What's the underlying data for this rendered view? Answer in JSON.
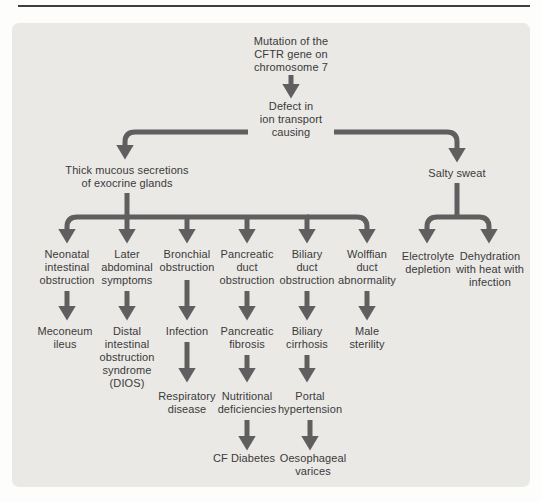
{
  "diagram": {
    "colors": {
      "arrow": "#5f5f5f",
      "text": "#3a3a3a",
      "panel_bg": "#eae9e6",
      "rule": "#3f3f3f"
    },
    "nodes": {
      "mutation": "Mutation of the\nCFTR gene on\nchromosome 7",
      "defect": "Defect in\nion transport\ncausing",
      "thick_mucous": "Thick mucous secretions\nof exocrine glands",
      "salty_sweat": "Salty sweat",
      "neonatal": "Neonatal\nintestinal\nobstruction",
      "later_abdominal": "Later\nabdominal\nsymptoms",
      "bronchial": "Bronchial\nobstruction",
      "pancreatic_duct": "Pancreatic\nduct\nobstruction",
      "biliary_duct": "Biliary\nduct\nobstruction",
      "wolffian": "Wolffian\nduct\nabnormality",
      "electrolyte": "Electrolyte\ndepletion",
      "dehydration": "Dehydration\nwith heat with\ninfection",
      "meconeum": "Meconeum\nileus",
      "dios": "Distal\nintestinal\nobstruction\nsyndrome\n(DIOS)",
      "infection": "Infection",
      "pancreatic_fibrosis": "Pancreatic\nfibrosis",
      "biliary_cirrhosis": "Biliary\ncirrhosis",
      "male_sterility": "Male\nsterility",
      "respiratory": "Respiratory\ndisease",
      "nutritional": "Nutritional\ndeficiencies",
      "portal": "Portal\nhypertension",
      "cf_diabetes": "CF Diabetes",
      "oesophageal": "Oesophageal\nvarices"
    },
    "edges": [
      [
        "mutation",
        "defect"
      ],
      [
        "defect",
        "thick_mucous"
      ],
      [
        "defect",
        "salty_sweat"
      ],
      [
        "thick_mucous",
        "neonatal"
      ],
      [
        "thick_mucous",
        "later_abdominal"
      ],
      [
        "thick_mucous",
        "bronchial"
      ],
      [
        "thick_mucous",
        "pancreatic_duct"
      ],
      [
        "thick_mucous",
        "biliary_duct"
      ],
      [
        "thick_mucous",
        "wolffian"
      ],
      [
        "salty_sweat",
        "electrolyte"
      ],
      [
        "salty_sweat",
        "dehydration"
      ],
      [
        "neonatal",
        "meconeum"
      ],
      [
        "later_abdominal",
        "dios"
      ],
      [
        "bronchial",
        "infection"
      ],
      [
        "pancreatic_duct",
        "pancreatic_fibrosis"
      ],
      [
        "biliary_duct",
        "biliary_cirrhosis"
      ],
      [
        "wolffian",
        "male_sterility"
      ],
      [
        "infection",
        "respiratory"
      ],
      [
        "pancreatic_fibrosis",
        "nutritional"
      ],
      [
        "biliary_cirrhosis",
        "portal"
      ],
      [
        "nutritional",
        "cf_diabetes"
      ],
      [
        "portal",
        "oesophageal"
      ]
    ]
  }
}
